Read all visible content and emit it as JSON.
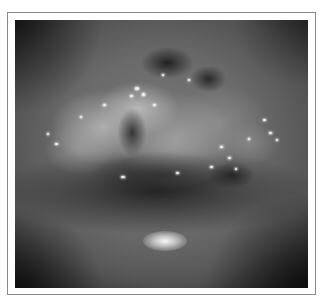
{
  "figure": {
    "type": "clinical-photograph",
    "color_mode": "grayscale",
    "frame": {
      "border_color": "#8a8a8a",
      "background": "#ffffff"
    },
    "photo": {
      "base_tone": "#6a6a6a",
      "subject": "raised irregular mucosal lesion with mottled light and dark areas above a dark fold, with specular glints and a bright reflection below"
    },
    "glints": [
      {
        "x": 135,
        "y": 87,
        "w": 4,
        "h": 3
      },
      {
        "x": 142,
        "y": 93,
        "w": 3,
        "h": 3
      },
      {
        "x": 130,
        "y": 95,
        "w": 3,
        "h": 2
      },
      {
        "x": 103,
        "y": 104,
        "w": 3,
        "h": 2
      },
      {
        "x": 153,
        "y": 104,
        "w": 3,
        "h": 2
      },
      {
        "x": 162,
        "y": 74,
        "w": 2,
        "h": 2
      },
      {
        "x": 188,
        "y": 79,
        "w": 2,
        "h": 2
      },
      {
        "x": 80,
        "y": 116,
        "w": 2,
        "h": 2
      },
      {
        "x": 55,
        "y": 143,
        "w": 3,
        "h": 2
      },
      {
        "x": 47,
        "y": 133,
        "w": 2,
        "h": 2
      },
      {
        "x": 263,
        "y": 119,
        "w": 3,
        "h": 2
      },
      {
        "x": 269,
        "y": 132,
        "w": 3,
        "h": 2
      },
      {
        "x": 276,
        "y": 139,
        "w": 2,
        "h": 2
      },
      {
        "x": 220,
        "y": 146,
        "w": 3,
        "h": 2
      },
      {
        "x": 228,
        "y": 157,
        "w": 3,
        "h": 2
      },
      {
        "x": 235,
        "y": 168,
        "w": 2,
        "h": 2
      },
      {
        "x": 121,
        "y": 176,
        "w": 4,
        "h": 2
      },
      {
        "x": 176,
        "y": 172,
        "w": 3,
        "h": 2
      },
      {
        "x": 210,
        "y": 166,
        "w": 3,
        "h": 2
      },
      {
        "x": 248,
        "y": 138,
        "w": 2,
        "h": 2
      }
    ]
  }
}
